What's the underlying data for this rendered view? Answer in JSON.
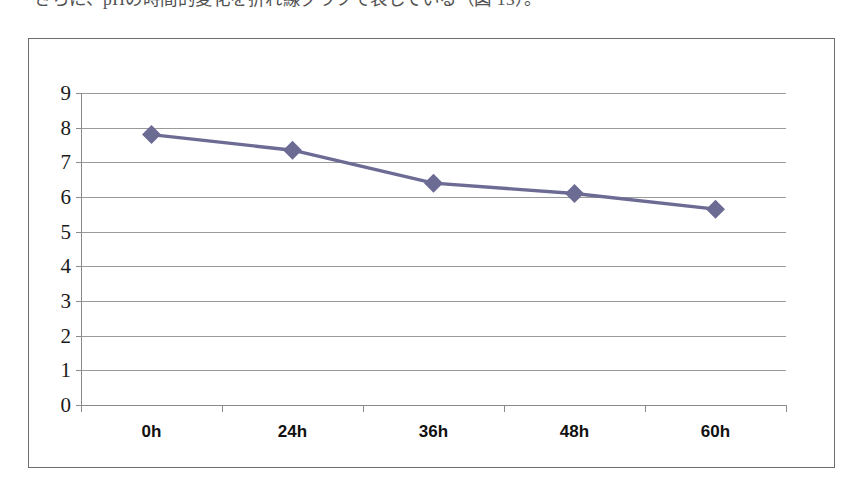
{
  "document": {
    "body_text_fragment": "さらに、pHの時間的変化を折れ線グラフで表している（図 13）。"
  },
  "chart": {
    "frame_border_color": "#6d6d6d",
    "gridline_color": "#9a9a9a",
    "axis_color": "#8a8a8a",
    "series_color": "#6b6b94"
  },
  "chart_data": {
    "type": "line",
    "title": "",
    "subtitle": "",
    "xlabel": "",
    "ylabel": "",
    "categories": [
      "0h",
      "24h",
      "36h",
      "48h",
      "60h"
    ],
    "series": [
      {
        "name": "pH",
        "values": [
          7.8,
          7.35,
          6.4,
          6.1,
          5.65
        ],
        "color": "#6b6b94",
        "marker": "diamond"
      }
    ],
    "ylim": [
      0,
      9
    ],
    "ytick_step": 1,
    "yticks": [
      0,
      1,
      2,
      3,
      4,
      5,
      6,
      7,
      8,
      9
    ],
    "ytick_labels": [
      "0",
      "1",
      "2",
      "3",
      "4",
      "5",
      "6",
      "7",
      "8",
      "9"
    ],
    "grid": true,
    "grid_axis": "y",
    "legend": false,
    "legend_position": "none"
  }
}
